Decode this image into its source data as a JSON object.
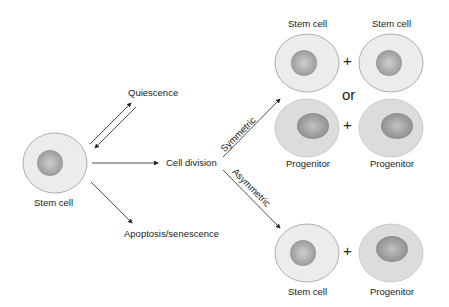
{
  "diagram": {
    "source_cell": {
      "label": "Stem cell"
    },
    "fates": {
      "quiescence": "Quiescence",
      "cell_division": "Cell division",
      "apoptosis": "Apoptosis/senescence"
    },
    "division_types": {
      "symmetric": "Symmetric",
      "asymmetric": "Asymmetric"
    },
    "symmetric_outcomes": {
      "option1": [
        "Stem cell",
        "Stem cell"
      ],
      "separator": "or",
      "option2": [
        "Progenitor",
        "Progenitor"
      ]
    },
    "asymmetric_outcome": [
      "Stem cell",
      "Progenitor"
    ],
    "plus": "+",
    "colors": {
      "stem_cytoplasm": "#ececec",
      "progenitor_cytoplasm": "#dcdcdc",
      "nucleus": "#a9a9a9",
      "outline": "#9a9a9a",
      "arrow": "#222222"
    }
  }
}
